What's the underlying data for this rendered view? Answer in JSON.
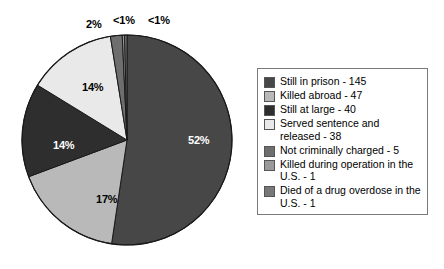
{
  "chart_data": {
    "type": "pie",
    "title": "",
    "subtitle": "",
    "xlabel": "",
    "ylabel": "",
    "legend_position": "right",
    "grid": false,
    "total": 277,
    "categories": [
      "Still in prison",
      "Killed abroad",
      "Still at large",
      "Served sentence and released",
      "Not criminally charged",
      "Killed during operation in the U.S.",
      "Died of a drug overdose in the U.S."
    ],
    "values": [
      145,
      47,
      40,
      38,
      5,
      1,
      1
    ],
    "percent_labels": [
      "52%",
      "17%",
      "14%",
      "14%",
      "2%",
      "<1%",
      "<1%"
    ],
    "percents": [
      52,
      17,
      14,
      14,
      2,
      0.4,
      0.4
    ],
    "colors": [
      "#474747",
      "#b9b9b9",
      "#2e2e2e",
      "#e9e9e9",
      "#6e6e6e",
      "#9a9a9a",
      "#787878"
    ],
    "slices": [
      {
        "label": "Still in prison",
        "value": 145,
        "percent_label": "52%",
        "color": "#474747",
        "label_color": "light"
      },
      {
        "label": "Killed abroad",
        "value": 47,
        "percent_label": "17%",
        "color": "#b9b9b9",
        "label_color": "dark"
      },
      {
        "label": "Still at large",
        "value": 40,
        "percent_label": "14%",
        "color": "#2e2e2e",
        "label_color": "light"
      },
      {
        "label": "Served sentence and released",
        "value": 38,
        "percent_label": "14%",
        "color": "#e9e9e9",
        "label_color": "dark"
      },
      {
        "label": "Not criminally charged",
        "value": 5,
        "percent_label": "2%",
        "color": "#6e6e6e",
        "label_color": "dark"
      },
      {
        "label": "Killed during operation in the U.S.",
        "value": 1,
        "percent_label": "<1%",
        "color": "#9a9a9a",
        "label_color": "dark"
      },
      {
        "label": "Died of a drug overdose in the U.S.",
        "value": 1,
        "percent_label": "<1%",
        "color": "#787878",
        "label_color": "dark"
      }
    ]
  },
  "legend": {
    "items": [
      {
        "label": "Still in prison - 145",
        "color": "#474747"
      },
      {
        "label": "Killed abroad - 47",
        "color": "#b9b9b9"
      },
      {
        "label": "Still at large - 40",
        "color": "#2e2e2e"
      },
      {
        "label": "Served sentence and released - 38",
        "color": "#e9e9e9"
      },
      {
        "label": "Not criminally charged - 5",
        "color": "#6e6e6e"
      },
      {
        "label": "Killed during operation in the U.S. - 1",
        "color": "#9a9a9a"
      },
      {
        "label": "Died of a drug overdose in the U.S. - 1",
        "color": "#787878"
      }
    ]
  },
  "pie_labels": [
    {
      "text": "52%",
      "x": 188,
      "y": 135,
      "tone": "light"
    },
    {
      "text": "17%",
      "x": 96,
      "y": 194,
      "tone": "dark"
    },
    {
      "text": "14%",
      "x": 53,
      "y": 140,
      "tone": "light"
    },
    {
      "text": "14%",
      "x": 82,
      "y": 82,
      "tone": "dark"
    },
    {
      "text": "2%",
      "x": 86,
      "y": 19,
      "tone": "dark"
    },
    {
      "text": "<1%",
      "x": 113,
      "y": 15,
      "tone": "dark"
    },
    {
      "text": "<1%",
      "x": 148,
      "y": 15,
      "tone": "dark"
    }
  ],
  "geometry": {
    "cx": 127,
    "cy": 140,
    "r": 105,
    "start_angle_deg": -90,
    "direction": "clockwise"
  }
}
